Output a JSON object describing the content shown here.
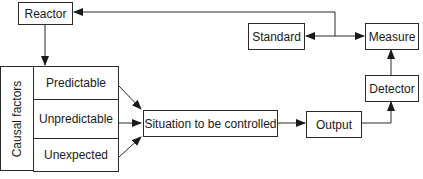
{
  "diagram": {
    "type": "control-loop block diagram",
    "nodes": {
      "reactor": "Reactor",
      "standard": "Standard",
      "measure": "Measure",
      "detector": "Detector",
      "output": "Output",
      "situation": "Situation to be controlled",
      "causal_factors_label": "Causal factors",
      "causal_factors": [
        "Predictable",
        "Unpredictable",
        "Unexpected"
      ]
    },
    "edges": [
      {
        "from": "Reactor",
        "to": "Causal factors"
      },
      {
        "from": "Predictable",
        "to": "Situation to be controlled"
      },
      {
        "from": "Unpredictable",
        "to": "Situation to be controlled"
      },
      {
        "from": "Unexpected",
        "to": "Situation to be controlled"
      },
      {
        "from": "Situation to be controlled",
        "to": "Output"
      },
      {
        "from": "Output",
        "to": "Detector"
      },
      {
        "from": "Detector",
        "to": "Measure"
      },
      {
        "from": "junction",
        "to": "Standard"
      },
      {
        "from": "junction",
        "to": "Measure"
      },
      {
        "from": "junction",
        "to": "Reactor"
      }
    ],
    "colors": {
      "line": "#2a2a2a",
      "background": "#ffffff"
    }
  }
}
